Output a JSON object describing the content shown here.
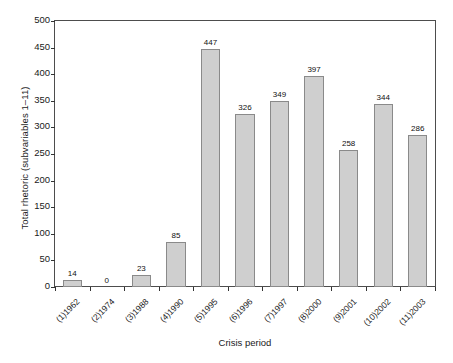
{
  "chart_data": {
    "type": "bar",
    "title": "",
    "subtitle": "",
    "xlabel": "Crisis period",
    "ylabel": "Total rhetoric (subvariables 1–11)",
    "categories": [
      "(1)1962",
      "(2)1974",
      "(3)1988",
      "(4)1990",
      "(5)1995",
      "(6)1996",
      "(7)1997",
      "(8)2000",
      "(9)2001",
      "(10)2002",
      "(11)2003"
    ],
    "values": [
      14,
      0,
      23,
      85,
      447,
      326,
      349,
      397,
      258,
      344,
      286
    ],
    "value_labels": [
      "14",
      "0",
      "23",
      "85",
      "447",
      "326",
      "349",
      "397",
      "258",
      "344",
      "286"
    ],
    "ylim": [
      0,
      500
    ],
    "ytick_labels": [
      "0",
      "50",
      "100",
      "150",
      "200",
      "250",
      "300",
      "350",
      "400",
      "450",
      "500"
    ],
    "ytick_values": [
      0,
      50,
      100,
      150,
      200,
      250,
      300,
      350,
      400,
      450,
      500
    ],
    "grid": false,
    "legend": "none",
    "bar_fill_color": "#cfcfcf",
    "bar_edge_color": "#8a8a8a",
    "axis_color": "#4d4d4d",
    "text_color": "#1a1a1a"
  }
}
